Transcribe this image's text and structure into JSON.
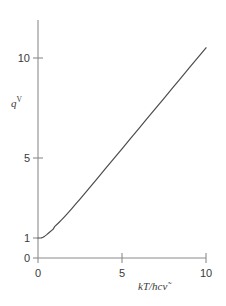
{
  "chart_data": {
    "type": "line",
    "title": "",
    "subtitle": "",
    "xlabel": "kT/hcṽ",
    "xlabel_parts": {
      "roman_prefix": "",
      "italic": "kT/hc",
      "symbol": "ν̃"
    },
    "ylabel": "qᵛ",
    "ylabel_parts": {
      "base": "q",
      "superscript": "V"
    },
    "xlim": [
      0,
      10
    ],
    "ylim": [
      0,
      11.6
    ],
    "xticks": [
      0,
      5,
      10
    ],
    "xticklabels": [
      "0",
      "5",
      "10"
    ],
    "yticks": [
      0,
      1,
      5,
      10
    ],
    "yticklabels": [
      "0",
      "1",
      "5",
      "10"
    ],
    "grid": false,
    "legend": null,
    "series": [
      {
        "name": "vibrational partition function",
        "color": "#4c4c4c",
        "linewidth": 1,
        "x": [
          0.0,
          0.1,
          0.2,
          0.3,
          0.4,
          0.5,
          0.6,
          0.7,
          0.8,
          0.9,
          1.0,
          1.2,
          1.4,
          1.6,
          1.8,
          2.0,
          2.25,
          2.5,
          2.75,
          3.0,
          3.5,
          4.0,
          4.5,
          5.0,
          5.5,
          6.0,
          6.5,
          7.0,
          7.5,
          8.0,
          8.5,
          9.0,
          9.5,
          10.0
        ],
        "y": [
          1.0,
          1.0,
          1.007,
          1.04,
          1.093,
          1.157,
          1.226,
          1.296,
          1.367,
          1.439,
          1.582,
          1.736,
          1.904,
          2.083,
          2.268,
          2.459,
          2.702,
          2.948,
          3.196,
          3.446,
          3.948,
          4.452,
          4.956,
          5.461,
          5.966,
          6.471,
          6.976,
          7.481,
          7.986,
          8.491,
          8.996,
          9.501,
          10.007,
          10.512
        ]
      }
    ],
    "annotations": [],
    "axes": {
      "spines": [
        "left",
        "bottom"
      ],
      "tick_direction": "out",
      "color": "#808080"
    }
  },
  "figure": {
    "background": "#ffffff",
    "axis_color": "#8c8c8c",
    "text_color": "#3a3a3a",
    "curve_color": "#4c4c4c"
  }
}
